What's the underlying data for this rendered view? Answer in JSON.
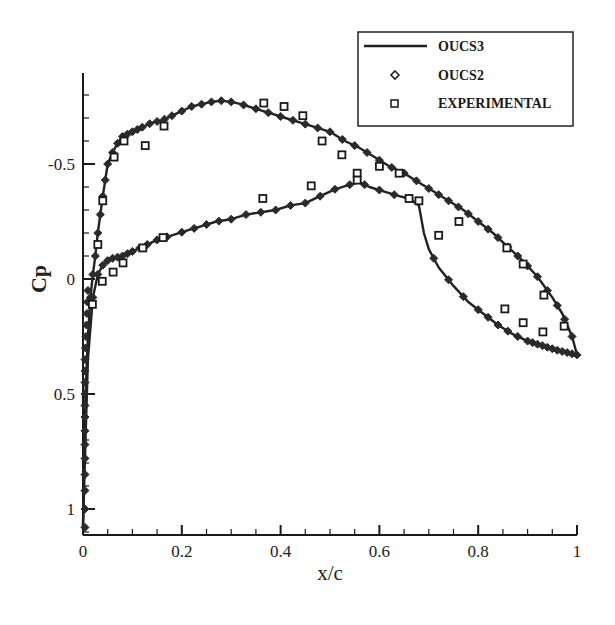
{
  "chart_data": {
    "type": "line",
    "title": "",
    "xlabel": "x/c",
    "ylabel": "Cp",
    "xlim": [
      0,
      1
    ],
    "ylim": [
      1.11,
      -0.9
    ],
    "y_inverted": true,
    "grid": false,
    "legend_position": "top-right",
    "x_ticks": [
      0,
      0.2,
      0.4,
      0.6,
      0.8,
      1
    ],
    "x_tick_labels": [
      "0",
      "0.2",
      "0.4",
      "0.6",
      "0.8",
      "1"
    ],
    "x_minor_step": 0.05,
    "y_ticks": [
      -0.5,
      0,
      0.5,
      1
    ],
    "y_tick_labels": [
      "-0.5",
      "0",
      "0.5",
      "1"
    ],
    "y_minor_step": 0.1,
    "legend": [
      {
        "label": "OUCS3",
        "marker": "line"
      },
      {
        "label": "OUCS2",
        "marker": "diamond"
      },
      {
        "label": "EXPERIMENTAL",
        "marker": "square"
      }
    ],
    "series": [
      {
        "name": "OUCS3",
        "style": "solid-line",
        "upper_surface": {
          "x": [
            0.0,
            0.002,
            0.005,
            0.01,
            0.015,
            0.02,
            0.025,
            0.03,
            0.04,
            0.05,
            0.06,
            0.07,
            0.08,
            0.1,
            0.12,
            0.14,
            0.16,
            0.18,
            0.2,
            0.22,
            0.24,
            0.26,
            0.28,
            0.3,
            0.32,
            0.35,
            0.38,
            0.41,
            0.44,
            0.47,
            0.5,
            0.53,
            0.56,
            0.59,
            0.62,
            0.65,
            0.68,
            0.71,
            0.74,
            0.77,
            0.8,
            0.83,
            0.86,
            0.89,
            0.92,
            0.95,
            0.97,
            0.99,
            1.0
          ],
          "cp": [
            1.08,
            0.8,
            0.5,
            0.25,
            0.08,
            -0.02,
            -0.1,
            -0.2,
            -0.36,
            -0.5,
            -0.55,
            -0.59,
            -0.62,
            -0.64,
            -0.66,
            -0.68,
            -0.69,
            -0.71,
            -0.73,
            -0.75,
            -0.76,
            -0.77,
            -0.775,
            -0.77,
            -0.76,
            -0.74,
            -0.72,
            -0.7,
            -0.68,
            -0.66,
            -0.64,
            -0.6,
            -0.57,
            -0.53,
            -0.49,
            -0.46,
            -0.42,
            -0.38,
            -0.34,
            -0.3,
            -0.25,
            -0.2,
            -0.14,
            -0.08,
            -0.01,
            0.08,
            0.15,
            0.25,
            0.33
          ]
        },
        "lower_surface": {
          "x": [
            0.0,
            0.005,
            0.01,
            0.02,
            0.03,
            0.04,
            0.05,
            0.06,
            0.08,
            0.1,
            0.12,
            0.15,
            0.18,
            0.21,
            0.24,
            0.27,
            0.3,
            0.33,
            0.36,
            0.39,
            0.42,
            0.45,
            0.48,
            0.51,
            0.54,
            0.56,
            0.58,
            0.61,
            0.64,
            0.66,
            0.68,
            0.69,
            0.7,
            0.72,
            0.75,
            0.78,
            0.81,
            0.84,
            0.87,
            0.9,
            0.93,
            0.96,
            0.98,
            1.0
          ],
          "cp": [
            1.08,
            0.7,
            0.35,
            0.08,
            -0.02,
            -0.06,
            -0.08,
            -0.09,
            -0.1,
            -0.12,
            -0.14,
            -0.17,
            -0.19,
            -0.21,
            -0.23,
            -0.25,
            -0.26,
            -0.28,
            -0.29,
            -0.3,
            -0.32,
            -0.33,
            -0.36,
            -0.39,
            -0.41,
            -0.42,
            -0.4,
            -0.38,
            -0.36,
            -0.35,
            -0.32,
            -0.2,
            -0.13,
            -0.05,
            0.03,
            0.1,
            0.15,
            0.2,
            0.24,
            0.27,
            0.29,
            0.31,
            0.32,
            0.33
          ]
        }
      },
      {
        "name": "OUCS2",
        "style": "diamond-markers",
        "note": "Coincides with OUCS3 curve on both surfaces"
      },
      {
        "name": "EXPERIMENTAL",
        "style": "square-markers",
        "points": [
          {
            "x": 0.019,
            "cp": 0.11
          },
          {
            "x": 0.03,
            "cp": -0.15
          },
          {
            "x": 0.04,
            "cp": -0.34
          },
          {
            "x": 0.063,
            "cp": -0.53
          },
          {
            "x": 0.083,
            "cp": -0.6
          },
          {
            "x": 0.126,
            "cp": -0.58
          },
          {
            "x": 0.164,
            "cp": -0.665
          },
          {
            "x": 0.366,
            "cp": -0.765
          },
          {
            "x": 0.407,
            "cp": -0.75
          },
          {
            "x": 0.445,
            "cp": -0.71
          },
          {
            "x": 0.484,
            "cp": -0.6
          },
          {
            "x": 0.524,
            "cp": -0.54
          },
          {
            "x": 0.6,
            "cp": -0.49
          },
          {
            "x": 0.64,
            "cp": -0.46
          },
          {
            "x": 0.761,
            "cp": -0.25
          },
          {
            "x": 0.858,
            "cp": -0.135
          },
          {
            "x": 0.891,
            "cp": -0.065
          },
          {
            "x": 0.933,
            "cp": 0.07
          },
          {
            "x": 0.974,
            "cp": 0.205
          },
          {
            "x": 0.039,
            "cp": 0.01
          },
          {
            "x": 0.061,
            "cp": -0.03
          },
          {
            "x": 0.081,
            "cp": -0.07
          },
          {
            "x": 0.121,
            "cp": -0.135
          },
          {
            "x": 0.162,
            "cp": -0.18
          },
          {
            "x": 0.364,
            "cp": -0.35
          },
          {
            "x": 0.462,
            "cp": -0.405
          },
          {
            "x": 0.555,
            "cp": -0.46
          },
          {
            "x": 0.555,
            "cp": -0.43
          },
          {
            "x": 0.66,
            "cp": -0.35
          },
          {
            "x": 0.68,
            "cp": -0.34
          },
          {
            "x": 0.72,
            "cp": -0.19
          },
          {
            "x": 0.854,
            "cp": 0.13
          },
          {
            "x": 0.891,
            "cp": 0.19
          },
          {
            "x": 0.931,
            "cp": 0.23
          }
        ]
      }
    ]
  },
  "axes": {
    "xlabel": "x/c",
    "ylabel": "Cp",
    "x_tick_labels": [
      "0",
      "0.2",
      "0.4",
      "0.6",
      "0.8",
      "1"
    ],
    "y_tick_labels": [
      "-0.5",
      "0",
      "0.5",
      "1"
    ]
  },
  "legend": {
    "items": [
      {
        "label": "OUCS3"
      },
      {
        "label": "OUCS2"
      },
      {
        "label": "EXPERIMENTAL"
      }
    ]
  },
  "colors": {
    "line": "#222222",
    "axis": "#1a1a1a",
    "background": "#ffffff"
  }
}
